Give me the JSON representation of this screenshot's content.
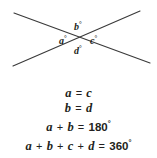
{
  "figure": {
    "diagram": {
      "type": "two-intersecting-lines",
      "stroke_color": "#3a3a3a",
      "intersection": {
        "x": 78,
        "y": 38
      },
      "lines": [
        {
          "name": "line-up-right",
          "x1": 13,
          "y1": 66,
          "x2": 140,
          "y2": 11
        },
        {
          "name": "line-down-right",
          "x1": 14,
          "y1": 13,
          "x2": 150,
          "y2": 63
        }
      ],
      "labels": [
        {
          "id": "a",
          "text": "a",
          "degree": "°",
          "position": "left"
        },
        {
          "id": "b",
          "text": "b",
          "degree": "°",
          "position": "top"
        },
        {
          "id": "c",
          "text": "c",
          "degree": "°",
          "position": "right"
        },
        {
          "id": "d",
          "text": "d",
          "degree": "°",
          "position": "bottom"
        }
      ]
    },
    "equations": [
      {
        "id": "eq-1",
        "text": "a = c",
        "parts": [
          {
            "t": "var",
            "v": "a"
          },
          {
            "t": "op",
            "v": "="
          },
          {
            "t": "var",
            "v": "c"
          }
        ]
      },
      {
        "id": "eq-2",
        "text": "b = d",
        "parts": [
          {
            "t": "var",
            "v": "b"
          },
          {
            "t": "op",
            "v": "="
          },
          {
            "t": "var",
            "v": "d"
          }
        ]
      },
      {
        "id": "eq-3",
        "text": "a + b = 180°",
        "parts": [
          {
            "t": "var",
            "v": "a"
          },
          {
            "t": "op",
            "v": "+"
          },
          {
            "t": "var",
            "v": "b"
          },
          {
            "t": "op",
            "v": "="
          },
          {
            "t": "num",
            "v": "180"
          },
          {
            "t": "deg",
            "v": "°"
          }
        ]
      },
      {
        "id": "eq-4",
        "text": "a + b + c + d = 360°",
        "parts": [
          {
            "t": "var",
            "v": "a"
          },
          {
            "t": "op",
            "v": "+"
          },
          {
            "t": "var",
            "v": "b"
          },
          {
            "t": "op",
            "v": "+"
          },
          {
            "t": "var",
            "v": "c"
          },
          {
            "t": "op",
            "v": "+"
          },
          {
            "t": "var",
            "v": "d"
          },
          {
            "t": "op",
            "v": "="
          },
          {
            "t": "num",
            "v": "360"
          },
          {
            "t": "deg",
            "v": "°"
          }
        ]
      }
    ]
  },
  "labels": {
    "a": "a",
    "b": "b",
    "c": "c",
    "d": "d",
    "degree": "°"
  },
  "colors": {
    "background": "#ffffff",
    "ink": "#231f20",
    "line": "#3a3a3a"
  }
}
